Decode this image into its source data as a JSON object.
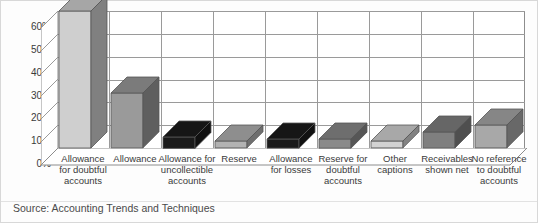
{
  "chart_data": {
    "type": "bar",
    "title": "",
    "subtitle": "",
    "xlabel": "",
    "ylabel": "",
    "ylim": [
      0,
      60
    ],
    "ytick_labels": [
      "0%",
      "10%",
      "20%",
      "30%",
      "40%",
      "50%",
      "60%"
    ],
    "ytick_values": [
      0,
      10,
      20,
      30,
      40,
      50,
      60
    ],
    "grid": true,
    "legend": "none",
    "categories": [
      "Allowance for doubtful accounts",
      "Allowance",
      "Allowance for uncollectible accounts",
      "Reserve",
      "Allowance for losses",
      "Reserve for doubtful accounts",
      "Other captions",
      "Receivables shown net",
      "No reference to doubtful accounts"
    ],
    "values": [
      60,
      24,
      5,
      3,
      4,
      4,
      3,
      7,
      10
    ],
    "bar_colors": [
      "#cfcfcf",
      "#9a9a9a",
      "#1b1b1b",
      "#b2b2b2",
      "#1b1b1b",
      "#8a8a8a",
      "#d2d2d2",
      "#7f7f7f",
      "#a8a8a8"
    ],
    "annotation": "Source: Accounting Trends and Techniques"
  },
  "axis": {
    "y_ticks": [
      {
        "label": "60%",
        "value": 60
      },
      {
        "label": "50%",
        "value": 50
      },
      {
        "label": "40%",
        "value": 40
      },
      {
        "label": "30%",
        "value": 30
      },
      {
        "label": "20%",
        "value": 20
      },
      {
        "label": "10%",
        "value": 10
      },
      {
        "label": "0%",
        "value": 0
      }
    ]
  },
  "categories_wrapped": [
    [
      "Allowance",
      "for doubtful",
      "accounts"
    ],
    [
      "Allowance"
    ],
    [
      "Allowance for",
      "uncollectible",
      "accounts"
    ],
    [
      "Reserve"
    ],
    [
      "Allowance",
      "for losses"
    ],
    [
      "Reserve for",
      "doubtful",
      "accounts"
    ],
    [
      "Other",
      "captions"
    ],
    [
      "Receivables",
      "shown net"
    ],
    [
      "No reference",
      "to doubtful",
      "accounts"
    ]
  ],
  "footer": {
    "source": "Source: Accounting Trends and Techniques"
  },
  "colors": {
    "axis_line": "#8d8d8d",
    "grid_line": "#9a9a9a",
    "text": "#3a3a3a",
    "background": "#fdfdfd",
    "frame": "#d8d8d8"
  }
}
